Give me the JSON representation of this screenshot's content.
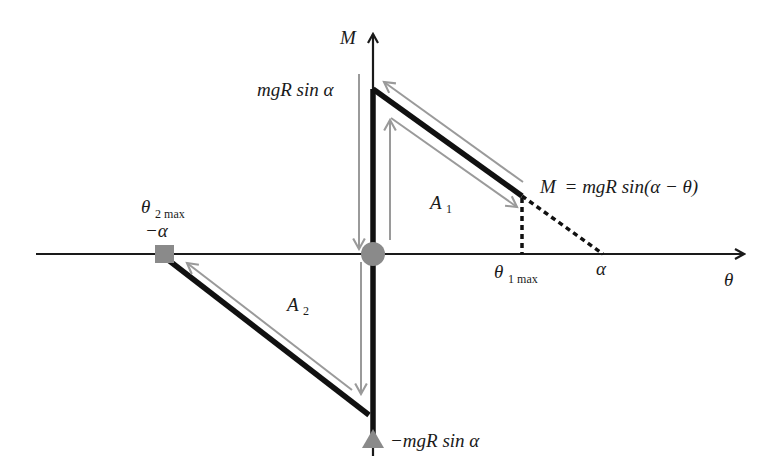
{
  "diagram": {
    "type": "moment-angle diagram",
    "axes": {
      "x_label": "θ",
      "y_label": "M"
    },
    "labels": {
      "top_value": "mgR sin α",
      "bottom_value": "−mgR sin α",
      "equation_lhs": "M",
      "equation_rhs": "= mgR sin(α − θ)",
      "theta1max_symbol": "θ",
      "theta1max_sub": "1 max",
      "alpha_tick": "α",
      "theta2max_symbol": "θ",
      "theta2max_sub": "2 max",
      "neg_alpha_tick": "−α",
      "area1_symbol": "A",
      "area1_sub": "1",
      "area2_symbol": "A",
      "area2_sub": "2"
    },
    "markers": [
      {
        "shape": "circle",
        "position": "origin",
        "color": "#888888"
      },
      {
        "shape": "square",
        "position": "θ2max = −α on θ-axis",
        "color": "#888888"
      },
      {
        "shape": "triangle",
        "position": "M = −mgR sin α on M-axis",
        "color": "#888888"
      }
    ],
    "colors": {
      "axis": "#1a1a1a",
      "curve": "#111111",
      "arrows": "#9a9a9a",
      "markers": "#888888"
    }
  }
}
